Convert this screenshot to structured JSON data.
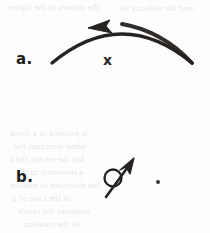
{
  "figure": {
    "background_color": "#fdfdfd",
    "ink_color": "#262220",
    "ghost_text_color": "#b9b3b3",
    "width": 210,
    "height": 233,
    "parts": [
      {
        "key": "a",
        "label": "a.",
        "label_x": 16,
        "label_y": 50,
        "description": "curved arrow arcing over, arrowhead pointing left",
        "annotation": {
          "text": "x",
          "x": 103,
          "y": 52
        },
        "arc": {
          "start_x": 52,
          "start_y": 63,
          "control_x": 122,
          "control_y": 5,
          "end_x": 192,
          "end_y": 63,
          "stroke_width": 3.4,
          "arrowhead": {
            "tip_x": 90,
            "tip_y": 28,
            "direction": "left"
          }
        }
      },
      {
        "key": "b",
        "label": "b.",
        "label_x": 16,
        "label_y": 168,
        "description": "diagonal arrow pointing up-right with a circle on its shaft, plus a small dot to the right",
        "arrow": {
          "tail_x": 106,
          "tail_y": 197,
          "tip_x": 134,
          "tip_y": 159,
          "stroke_width": 2.6
        },
        "circle": {
          "center_x": 113,
          "center_y": 178,
          "radius": 8.5,
          "stroke_width": 2.2,
          "filled": false
        },
        "dot": {
          "center_x": 158,
          "center_y": 182,
          "radius": 2.0,
          "filled": true
        }
      }
    ],
    "ghost_lines": [
      {
        "text": "the arrows in the figure",
        "x": 8,
        "y": 2,
        "size": 9
      },
      {
        "text": "and the velocity of",
        "x": 120,
        "y": 3,
        "size": 9
      },
      {
        "text": "is pointed in a fixed",
        "x": 10,
        "y": 128,
        "size": 9
      },
      {
        "text": "same direction the",
        "x": 14,
        "y": 141,
        "size": 9
      },
      {
        "text": "but the vector field",
        "x": 10,
        "y": 154,
        "size": 9
      },
      {
        "text": "a reference to the",
        "x": 16,
        "y": 167,
        "size": 9
      },
      {
        "text": "the direction of motion",
        "x": 10,
        "y": 180,
        "size": 9
      },
      {
        "text": "in the case of a",
        "x": 12,
        "y": 193,
        "size": 9
      },
      {
        "text": "constant the result",
        "x": 18,
        "y": 206,
        "size": 9
      },
      {
        "text": "of the rotation",
        "x": 24,
        "y": 219,
        "size": 9
      }
    ]
  }
}
